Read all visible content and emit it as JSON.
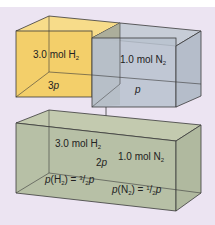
{
  "diagram": {
    "top": {
      "left_box": {
        "amount": "3.0 mol",
        "gas": "H",
        "gas_sub": "2",
        "pressure_coef": "3",
        "pressure_var": "p",
        "color": "#f3cf6a"
      },
      "right_box": {
        "amount": "1.0 mol",
        "gas": "N",
        "gas_sub": "2",
        "pressure_var": "p",
        "color": "#b9c2cf"
      }
    },
    "bottom": {
      "h2_amount": "3.0 mol",
      "h2_gas": "H",
      "h2_sub": "2",
      "n2_amount": "1.0 mol",
      "n2_gas": "N",
      "n2_sub": "2",
      "total_coef": "2",
      "total_var": "p",
      "partial_h2": {
        "p": "p",
        "open": "(H",
        "sub": "2",
        "close": ") = ",
        "num": "3",
        "den": "2",
        "var": "p"
      },
      "partial_n2": {
        "p": "p",
        "open": "(N",
        "sub": "2",
        "close": ") = ",
        "num": "1",
        "den": "2",
        "var": "p"
      },
      "color": "#b7c0a6"
    },
    "colors": {
      "background": "#ece4f2",
      "edge": "#3a3a3a"
    }
  }
}
